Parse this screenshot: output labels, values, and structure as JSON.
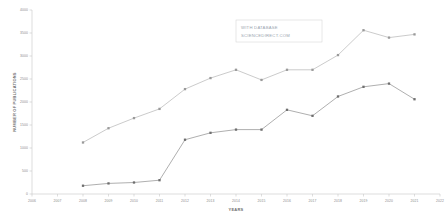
{
  "chart_data": {
    "type": "line",
    "title": "",
    "xlabel": "YEARS",
    "ylabel": "NUMBER OF PUBLICATIONS",
    "grid": false,
    "legend_position": "none",
    "xlim": [
      2006,
      2022
    ],
    "ylim": [
      0,
      4000
    ],
    "x_tick_labels": [
      "2006",
      "2007",
      "2008",
      "2009",
      "2010",
      "2011",
      "2012",
      "2013",
      "2014",
      "2015",
      "2016",
      "2017",
      "2018",
      "2019",
      "2020",
      "2021",
      "2022"
    ],
    "y_tick_labels": [
      "0",
      "500",
      "1000",
      "1500",
      "2000",
      "2500",
      "3000",
      "3500",
      "4000"
    ],
    "y_tick_values": [
      0,
      500,
      1000,
      1500,
      2000,
      2500,
      3000,
      3500,
      4000
    ],
    "x": [
      2008,
      2009,
      2010,
      2011,
      2012,
      2013,
      2014,
      2015,
      2016,
      2017,
      2018,
      2019,
      2020,
      2021
    ],
    "series": [
      {
        "name": "upper-series",
        "color": "#b4b4b4",
        "marker_color": "#9a9a9a",
        "values": [
          1120,
          1430,
          1650,
          1850,
          2280,
          2520,
          2700,
          2480,
          2700,
          2700,
          3020,
          3560,
          3400,
          3470
        ]
      },
      {
        "name": "lower-series",
        "color": "#8c8c8c",
        "marker_color": "#6e6e6e",
        "values": [
          180,
          230,
          250,
          300,
          1180,
          1330,
          1400,
          1400,
          1830,
          1700,
          2120,
          2330,
          2400,
          2060
        ]
      }
    ],
    "annotations": [
      {
        "name": "watermark",
        "line1": "WITH DATABASE",
        "line2": "SCIENCEDIRECT.COM"
      }
    ]
  },
  "colors": {
    "background": "#ffffff",
    "axis": "#c8c8c8",
    "tick_text": "#8a8a8a",
    "axis_title": "#6f6f6f",
    "watermark_text": "#9aa4ae"
  }
}
